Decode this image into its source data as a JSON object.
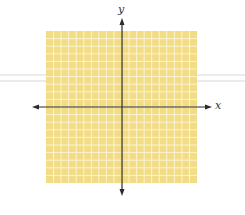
{
  "diagram": {
    "type": "coordinate-plane",
    "x_axis_label": "x",
    "y_axis_label": "y",
    "grid": {
      "columns": 20,
      "rows": 20,
      "left": 46,
      "top": 31,
      "right": 197,
      "bottom": 183,
      "fill_color": "#f2dc86",
      "line_color": "#fbf3d2"
    },
    "origin": {
      "x": 122,
      "y": 107
    },
    "axes": {
      "color": "#2a2a2a",
      "x_start": 32,
      "x_end": 212,
      "y_start": 18,
      "y_end": 196
    }
  }
}
